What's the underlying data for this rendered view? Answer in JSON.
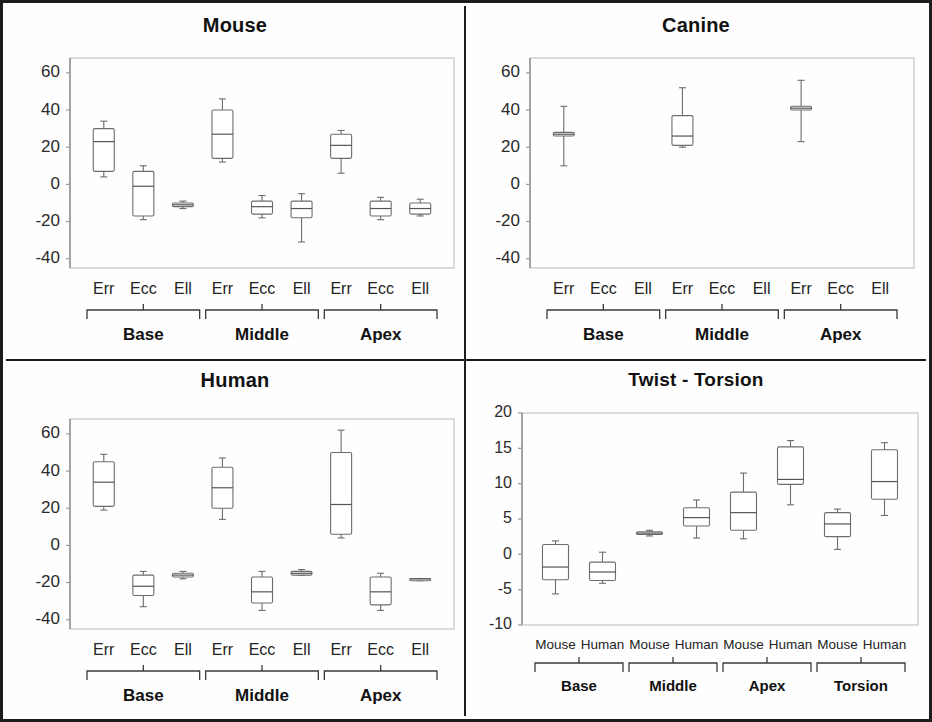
{
  "figure": {
    "panels": [
      {
        "id": "mouse",
        "title": "Mouse",
        "y_ticks": [
          "60",
          "40",
          "20",
          "0",
          "-20",
          "-40"
        ],
        "group_labels": [
          "Base",
          "Middle",
          "Apex"
        ],
        "category_labels": [
          "Err",
          "Ecc",
          "Ell",
          "Err",
          "Ecc",
          "Ell",
          "Err",
          "Ecc",
          "Ell"
        ]
      },
      {
        "id": "canine",
        "title": "Canine",
        "y_ticks": [
          "60",
          "40",
          "20",
          "0",
          "-20",
          "-40"
        ],
        "group_labels": [
          "Base",
          "Middle",
          "Apex"
        ],
        "category_labels": [
          "Err",
          "Ecc",
          "Ell",
          "Err",
          "Ecc",
          "Ell",
          "Err",
          "Ecc",
          "Ell"
        ]
      },
      {
        "id": "human",
        "title": "Human",
        "y_ticks": [
          "60",
          "40",
          "20",
          "0",
          "-20",
          "-40"
        ],
        "group_labels": [
          "Base",
          "Middle",
          "Apex"
        ],
        "category_labels": [
          "Err",
          "Ecc",
          "Ell",
          "Err",
          "Ecc",
          "Ell",
          "Err",
          "Ecc",
          "Ell"
        ]
      },
      {
        "id": "twist",
        "title": "Twist - Torsion",
        "y_ticks": [
          "20",
          "15",
          "10",
          "5",
          "0",
          "-5",
          "-10"
        ],
        "group_labels": [
          "Base",
          "Middle",
          "Apex",
          "Torsion"
        ],
        "category_labels": [
          "Mouse",
          "Human",
          "Mouse",
          "Human",
          "Mouse",
          "Human",
          "Mouse",
          "Human"
        ]
      }
    ]
  },
  "chart_data": [
    {
      "type": "box",
      "panel": "Mouse",
      "title": "Mouse",
      "xlabel": "",
      "ylabel": "",
      "ylim": [
        -45,
        68
      ],
      "yticks": [
        60,
        40,
        20,
        0,
        -20,
        -40
      ],
      "grid": false,
      "groups": [
        "Base",
        "Middle",
        "Apex"
      ],
      "categories": [
        "Err",
        "Ecc",
        "Ell"
      ],
      "boxes": [
        {
          "group": "Base",
          "category": "Err",
          "whisker_low": 4,
          "q1": 7,
          "median": 23,
          "q3": 30,
          "whisker_high": 34
        },
        {
          "group": "Base",
          "category": "Ecc",
          "whisker_low": -19,
          "q1": -17,
          "median": -1,
          "q3": 7,
          "whisker_high": 10
        },
        {
          "group": "Base",
          "category": "Ell",
          "whisker_low": -13,
          "q1": -12,
          "median": -11,
          "q3": -10,
          "whisker_high": -9
        },
        {
          "group": "Middle",
          "category": "Err",
          "whisker_low": 12,
          "q1": 14,
          "median": 27,
          "q3": 40,
          "whisker_high": 46
        },
        {
          "group": "Middle",
          "category": "Ecc",
          "whisker_low": -18,
          "q1": -16,
          "median": -12,
          "q3": -9,
          "whisker_high": -6
        },
        {
          "group": "Middle",
          "category": "Ell",
          "whisker_low": -31,
          "q1": -18,
          "median": -13,
          "q3": -9,
          "whisker_high": -5
        },
        {
          "group": "Apex",
          "category": "Err",
          "whisker_low": 6,
          "q1": 14,
          "median": 21,
          "q3": 27,
          "whisker_high": 29
        },
        {
          "group": "Apex",
          "category": "Ecc",
          "whisker_low": -19,
          "q1": -17,
          "median": -13,
          "q3": -9,
          "whisker_high": -7
        },
        {
          "group": "Apex",
          "category": "Ell",
          "whisker_low": -17,
          "q1": -16,
          "median": -13,
          "q3": -10,
          "whisker_high": -8
        }
      ]
    },
    {
      "type": "box",
      "panel": "Canine",
      "title": "Canine",
      "xlabel": "",
      "ylabel": "",
      "ylim": [
        -45,
        68
      ],
      "yticks": [
        60,
        40,
        20,
        0,
        -20,
        -40
      ],
      "grid": false,
      "groups": [
        "Base",
        "Middle",
        "Apex"
      ],
      "categories": [
        "Err",
        "Ecc",
        "Ell"
      ],
      "boxes": [
        {
          "group": "Base",
          "category": "Err",
          "whisker_low": 10,
          "q1": 26,
          "median": 27,
          "q3": 28,
          "whisker_high": 42
        },
        {
          "group": "Base",
          "category": "Ecc",
          "empty": true
        },
        {
          "group": "Base",
          "category": "Ell",
          "empty": true
        },
        {
          "group": "Middle",
          "category": "Err",
          "whisker_low": 20,
          "q1": 21,
          "median": 26,
          "q3": 37,
          "whisker_high": 52
        },
        {
          "group": "Middle",
          "category": "Ecc",
          "empty": true
        },
        {
          "group": "Middle",
          "category": "Ell",
          "empty": true
        },
        {
          "group": "Apex",
          "category": "Err",
          "whisker_low": 23,
          "q1": 40,
          "median": 41,
          "q3": 42,
          "whisker_high": 56
        },
        {
          "group": "Apex",
          "category": "Ecc",
          "empty": true
        },
        {
          "group": "Apex",
          "category": "Ell",
          "empty": true
        }
      ]
    },
    {
      "type": "box",
      "panel": "Human",
      "title": "Human",
      "xlabel": "",
      "ylabel": "",
      "ylim": [
        -45,
        68
      ],
      "yticks": [
        60,
        40,
        20,
        0,
        -20,
        -40
      ],
      "grid": false,
      "groups": [
        "Base",
        "Middle",
        "Apex"
      ],
      "categories": [
        "Err",
        "Ecc",
        "Ell"
      ],
      "boxes": [
        {
          "group": "Base",
          "category": "Err",
          "whisker_low": 19,
          "q1": 21,
          "median": 34,
          "q3": 45,
          "whisker_high": 49
        },
        {
          "group": "Base",
          "category": "Ecc",
          "whisker_low": -33,
          "q1": -27,
          "median": -22,
          "q3": -16,
          "whisker_high": -14
        },
        {
          "group": "Base",
          "category": "Ell",
          "whisker_low": -18,
          "q1": -17,
          "median": -16,
          "q3": -15,
          "whisker_high": -14
        },
        {
          "group": "Middle",
          "category": "Err",
          "whisker_low": 14,
          "q1": 20,
          "median": 31,
          "q3": 42,
          "whisker_high": 47
        },
        {
          "group": "Middle",
          "category": "Ecc",
          "whisker_low": -35,
          "q1": -31,
          "median": -25,
          "q3": -17,
          "whisker_high": -14
        },
        {
          "group": "Middle",
          "category": "Ell",
          "whisker_low": -16,
          "q1": -16,
          "median": -15,
          "q3": -14,
          "whisker_high": -13
        },
        {
          "group": "Apex",
          "category": "Err",
          "whisker_low": 4,
          "q1": 6,
          "median": 22,
          "q3": 50,
          "whisker_high": 62
        },
        {
          "group": "Apex",
          "category": "Ecc",
          "whisker_low": -35,
          "q1": -32,
          "median": -25,
          "q3": -17,
          "whisker_high": -15
        },
        {
          "group": "Apex",
          "category": "Ell",
          "whisker_low": -19,
          "q1": -19,
          "median": -18,
          "q3": -18,
          "whisker_high": -18
        }
      ]
    },
    {
      "type": "box",
      "panel": "Twist - Torsion",
      "title": "Twist - Torsion",
      "xlabel": "",
      "ylabel": "",
      "ylim": [
        -10,
        20
      ],
      "yticks": [
        20,
        15,
        10,
        5,
        0,
        -5,
        -10
      ],
      "grid": false,
      "groups": [
        "Base",
        "Middle",
        "Apex",
        "Torsion"
      ],
      "categories": [
        "Mouse",
        "Human"
      ],
      "boxes": [
        {
          "group": "Base",
          "category": "Mouse",
          "whisker_low": -5.6,
          "q1": -3.6,
          "median": -1.8,
          "q3": 1.4,
          "whisker_high": 1.9
        },
        {
          "group": "Base",
          "category": "Human",
          "whisker_low": -4.1,
          "q1": -3.7,
          "median": -2.5,
          "q3": -1.1,
          "whisker_high": 0.3
        },
        {
          "group": "Middle",
          "category": "Mouse",
          "whisker_low": 2.6,
          "q1": 2.8,
          "median": 3.0,
          "q3": 3.2,
          "whisker_high": 3.4
        },
        {
          "group": "Middle",
          "category": "Human",
          "whisker_low": 2.3,
          "q1": 4.0,
          "median": 5.2,
          "q3": 6.6,
          "whisker_high": 7.7
        },
        {
          "group": "Apex",
          "category": "Mouse",
          "whisker_low": 2.2,
          "q1": 3.4,
          "median": 5.9,
          "q3": 8.8,
          "whisker_high": 11.5
        },
        {
          "group": "Apex",
          "category": "Human",
          "whisker_low": 7.0,
          "q1": 9.9,
          "median": 10.6,
          "q3": 15.2,
          "whisker_high": 16.1
        },
        {
          "group": "Torsion",
          "category": "Mouse",
          "whisker_low": 0.7,
          "q1": 2.5,
          "median": 4.3,
          "q3": 5.9,
          "whisker_high": 6.4
        },
        {
          "group": "Torsion",
          "category": "Human",
          "whisker_low": 5.5,
          "q1": 7.8,
          "median": 10.3,
          "q3": 14.8,
          "whisker_high": 15.8
        }
      ]
    }
  ]
}
